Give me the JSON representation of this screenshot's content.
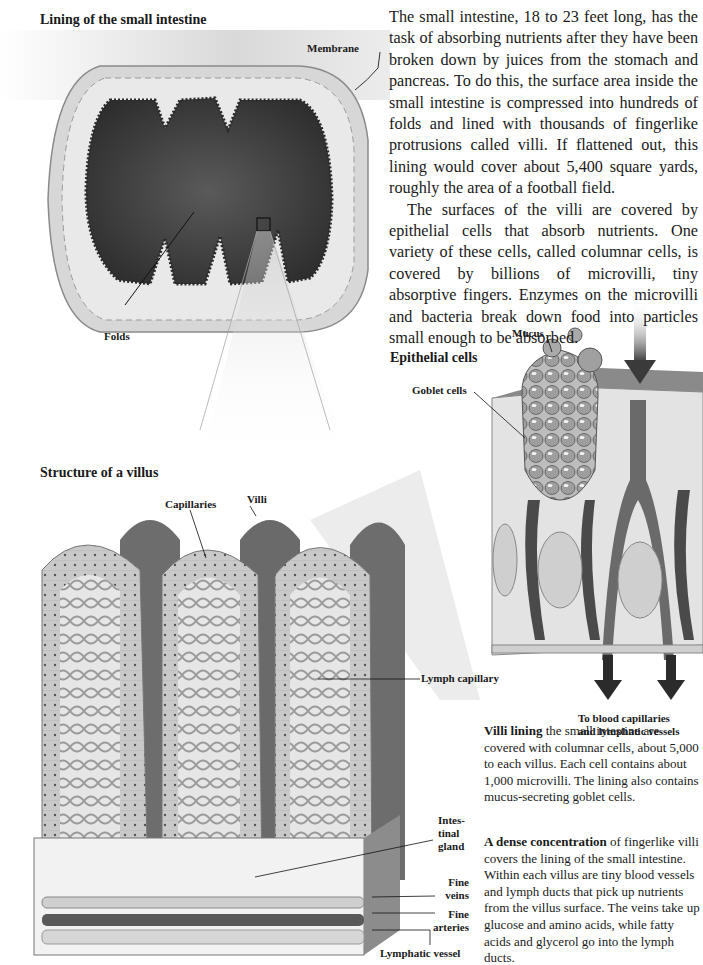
{
  "lining_diagram": {
    "title": "Lining of the small intestine",
    "labels": {
      "membrane": "Membrane",
      "folds": "Folds"
    }
  },
  "intro_text": {
    "paragraphs": [
      "The small intestine, 18 to 23 feet long, has the task of absorbing nutrients after they have been broken down by juices from the stomach and pancreas. To do this, the surface area inside the small intestine is compressed into hundreds of folds and lined with thousands of fingerlike protrusions called villi. If flattened out, this lining would cover about 5,400 square yards, roughly the area of a football field.",
      "The surfaces of the villi are covered by epithelial cells that absorb nutrients. One variety of these cells, called columnar cells, is covered by billions of microvilli, tiny absorptive fingers. Enzymes on the microvilli and bacteria break down food into particles small enough to be absorbed."
    ]
  },
  "epithelial_diagram": {
    "title": "Epithelial cells",
    "labels": {
      "mucus": "Mucus",
      "goblet_cells": "Goblet cells",
      "to_vessels_line1": "To blood capillaries",
      "to_vessels_line2": "and lymphatic vessels"
    }
  },
  "villus_diagram": {
    "title": "Structure of a villus",
    "labels": {
      "capillaries": "Capillaries",
      "villi": "Villi",
      "lymph_capillary": "Lymph capillary",
      "intestinal_gland_1": "Intes-",
      "intestinal_gland_2": "tinal",
      "intestinal_gland_3": "gland",
      "fine_veins_1": "Fine",
      "fine_veins_2": "veins",
      "fine_arteries_1": "Fine",
      "fine_arteries_2": "arteries",
      "lymphatic_vessel": "Lymphatic vessel"
    }
  },
  "captions": {
    "villi_lining": {
      "lead": "Villi lining",
      "text": " the small intestine are covered with columnar cells, about 5,000 to each villus. Each cell contains about 1,000 microvilli. The lining also contains mucus-secreting goblet cells."
    },
    "dense_concentration": {
      "lead": "A dense concentration",
      "text": " of fingerlike villi covers the lining of the small intestine. Within each villus are tiny blood vessels and lymph ducts that pick up nutrients from the villus surface. The veins take up glucose and amino acids, while fatty acids and glycerol go into the lymph ducts."
    }
  }
}
